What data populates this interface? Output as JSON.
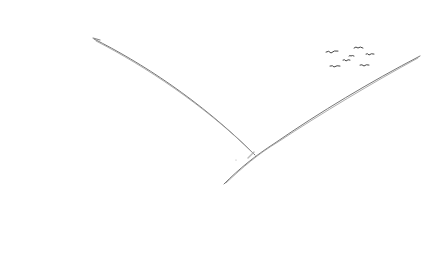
{
  "image": {
    "description": "Pencil sketch of two hillside lines forming a V shape with a small flock of birds in the upper right",
    "background": "#ffffff",
    "stroke_color": "#6a6a6a",
    "elements": {
      "left_line": "left-slope",
      "right_line": "right-slope",
      "birds": "flock-of-birds",
      "bird_count": 7
    }
  }
}
